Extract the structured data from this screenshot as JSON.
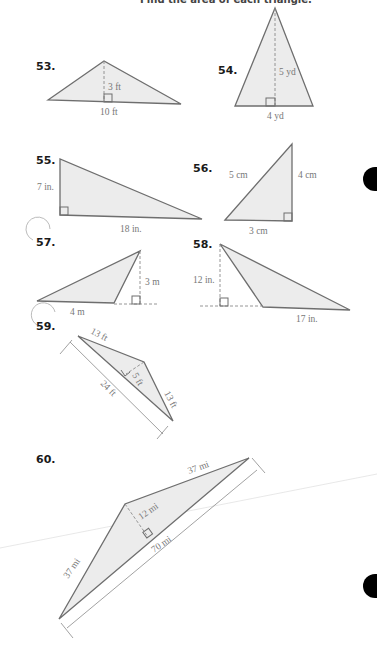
{
  "header": {
    "text": "Find the area of each triangle."
  },
  "problems": [
    {
      "number": "53.",
      "labels": {
        "height": "3 ft",
        "base": "10 ft"
      }
    },
    {
      "number": "54.",
      "labels": {
        "height": "5 yd",
        "base": "4 yd"
      }
    },
    {
      "number": "55.",
      "labels": {
        "height": "7 in.",
        "base": "18 in."
      }
    },
    {
      "number": "56.",
      "labels": {
        "hypotenuse": "5 cm",
        "height": "4 cm",
        "base": "3 cm"
      }
    },
    {
      "number": "57.",
      "labels": {
        "height": "3 m",
        "base": "4 m"
      }
    },
    {
      "number": "58.",
      "labels": {
        "height": "12 in.",
        "base": "17 in."
      }
    },
    {
      "number": "59.",
      "labels": {
        "side1": "13 ft",
        "height": "5 ft",
        "base": "24 ft",
        "side2": "13 ft"
      }
    },
    {
      "number": "60.",
      "labels": {
        "side1": "37 mi",
        "height": "12 mi",
        "base": "70 mi",
        "side2": "37 mi"
      }
    }
  ],
  "binder_holes": 2
}
